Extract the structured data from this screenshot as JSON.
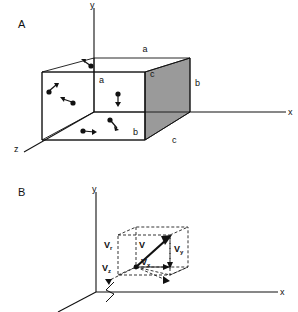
{
  "figure": {
    "background_color": "#ffffff",
    "line_color": "#111111",
    "shaded_face_color": "#9a9a9a",
    "width": 298,
    "height": 312
  },
  "panel_a": {
    "label": "A",
    "axes": {
      "x_label": "x",
      "y_label": "y",
      "z_label": "z"
    },
    "dimension_labels": [
      {
        "id": "a-top",
        "text": "a"
      },
      {
        "id": "a-inner",
        "text": "a"
      },
      {
        "id": "c-upper",
        "text": "c"
      },
      {
        "id": "b-right",
        "text": "b"
      },
      {
        "id": "b-inner",
        "text": "b"
      },
      {
        "id": "c-lower",
        "text": "c"
      }
    ],
    "shaded_face": {
      "name": "right-end-face",
      "color": "#9a9a9a"
    },
    "particles": [
      {
        "id": "p1",
        "dot_x": 91,
        "dot_y": 66,
        "tip_x": 83,
        "tip_y": 60
      },
      {
        "id": "p2",
        "dot_x": 118,
        "dot_y": 95,
        "tip_x": 118,
        "tip_y": 104
      },
      {
        "id": "p3",
        "dot_x": 49,
        "dot_y": 91,
        "tip_x": 57,
        "tip_y": 84
      },
      {
        "id": "p4",
        "dot_x": 72,
        "dot_y": 102,
        "tip_x": 62,
        "tip_y": 98
      },
      {
        "id": "p5",
        "dot_x": 111,
        "dot_y": 120,
        "tip_x": 118,
        "tip_y": 128
      },
      {
        "id": "p6",
        "dot_x": 83,
        "dot_y": 131,
        "tip_x": 94,
        "tip_y": 133
      }
    ]
  },
  "panel_b": {
    "label": "B",
    "axes": {
      "x_label": "x",
      "y_label": "y"
    },
    "vectors": [
      {
        "id": "v-resultant",
        "base": "V",
        "sub": ""
      },
      {
        "id": "v-r",
        "base": "V",
        "sub": "r"
      },
      {
        "id": "v-x",
        "base": "V",
        "sub": "x"
      },
      {
        "id": "v-y",
        "base": "V",
        "sub": "y"
      },
      {
        "id": "v-z",
        "base": "V",
        "sub": "z"
      }
    ],
    "axis_break_marker": "zigzag"
  }
}
